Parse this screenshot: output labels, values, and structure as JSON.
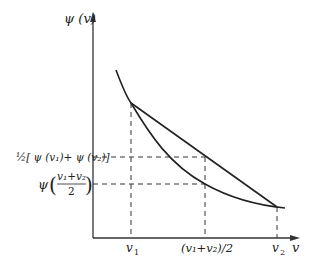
{
  "diagram": {
    "type": "convex-function-illustration",
    "y_axis_label": "ψ (v)",
    "x_axis_label": "v",
    "x_ticks": [
      {
        "id": "v1",
        "label": "v",
        "sub": "1"
      },
      {
        "id": "mid",
        "label": "(v₁+v₂)/2"
      },
      {
        "id": "v2",
        "label": "v",
        "sub": "2"
      }
    ],
    "y_labels": {
      "upper": {
        "prefix": "½[ ψ (v₁)+ ψ (v₂)]"
      },
      "lower": {
        "psi": "ψ",
        "num": "v₁+v₂",
        "den": "2"
      }
    },
    "elements": [
      "convex curve ψ(v)",
      "chord from (v₁,ψ(v₁)) to (v₂,ψ(v₂))",
      "dashed guide lines"
    ],
    "colors": {
      "line": "#222222",
      "background": "#ffffff"
    }
  }
}
